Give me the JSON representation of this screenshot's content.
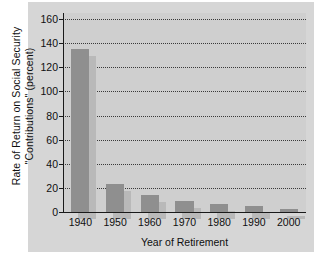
{
  "chart_data": {
    "type": "bar",
    "title": "",
    "xlabel": "Year of Retirement",
    "ylabel_line1": "Rate of Return on Social Security",
    "ylabel_line2": "\"Contributions\" (percent)",
    "categories": [
      "1940",
      "1950",
      "1960",
      "1970",
      "1980",
      "1990",
      "2000"
    ],
    "values": [
      135,
      23.5,
      14,
      9.5,
      7,
      5,
      2.5
    ],
    "ylim": [
      0,
      165
    ],
    "yticks": [
      0,
      20,
      40,
      60,
      80,
      100,
      120,
      140,
      160
    ],
    "ytick_labels": [
      "0",
      "20",
      "40",
      "60",
      "80",
      "100",
      "120",
      "140",
      "160"
    ],
    "grid": true,
    "grid_style": "dotted",
    "legend": "none",
    "bar_color": "#8f8f8f",
    "bar_shadow_color": "#b9b9b9",
    "plot_background": "#cfcfcf",
    "figure_background": "#d6d6d6",
    "axis_color": "#1a1a1a"
  }
}
